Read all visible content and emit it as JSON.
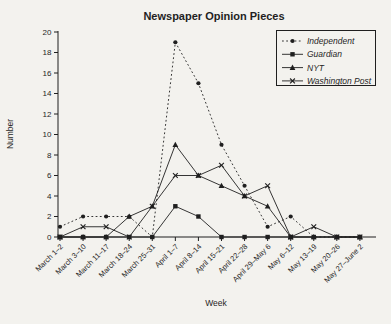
{
  "colors": {
    "background": "#f3f2ee",
    "ink": "#1f1f1f"
  },
  "chart_data": {
    "type": "line",
    "title": "Newspaper Opinion Pieces",
    "xlabel": "Week",
    "ylabel": "Number",
    "ylim": [
      0,
      20
    ],
    "yticks": [
      0,
      2,
      4,
      6,
      8,
      10,
      12,
      14,
      16,
      18,
      20
    ],
    "grid": false,
    "legend_position": "top-right",
    "categories": [
      "March 1–2",
      "March 3–10",
      "March 11–17",
      "March 18–24",
      "March 25–31",
      "April 1–7",
      "April 8–14",
      "April 15–21",
      "April 22–28",
      "April 29–May 6",
      "May 6–12",
      "May 13–19",
      "May 20–26",
      "May 27–June 2"
    ],
    "series": [
      {
        "name": "Independent",
        "marker": "circle",
        "line_style": "dotted",
        "values": [
          1,
          2,
          2,
          2,
          0,
          19,
          15,
          9,
          5,
          1,
          2,
          0,
          0,
          0
        ]
      },
      {
        "name": "Guardian",
        "marker": "square",
        "line_style": "solid",
        "values": [
          0,
          0,
          0,
          0,
          0,
          3,
          2,
          0,
          0,
          0,
          0,
          0,
          0,
          0
        ]
      },
      {
        "name": "NYT",
        "marker": "triangle",
        "line_style": "solid",
        "values": [
          0,
          0,
          0,
          2,
          3,
          9,
          6,
          5,
          4,
          3,
          0,
          0,
          0,
          0
        ]
      },
      {
        "name": "Washington Post",
        "marker": "x",
        "line_style": "solid",
        "values": [
          0,
          1,
          1,
          0,
          3,
          6,
          6,
          7,
          4,
          5,
          0,
          1,
          0,
          0
        ]
      }
    ]
  }
}
